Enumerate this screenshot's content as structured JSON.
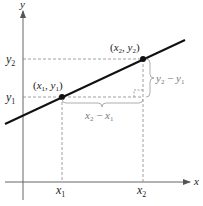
{
  "diagram": {
    "axes": {
      "x_label": "x",
      "y_label": "y",
      "x_ticks": [
        {
          "main": "x",
          "sub": "1"
        },
        {
          "main": "x",
          "sub": "2"
        }
      ],
      "y_ticks": [
        {
          "main": "y",
          "sub": "1"
        },
        {
          "main": "y",
          "sub": "2"
        }
      ]
    },
    "points": [
      {
        "label": "(x₁, y₁)",
        "parts": {
          "open": "(",
          "x": "x",
          "xs": "1",
          "comma": ", ",
          "y": "y",
          "ys": "1",
          "close": ")"
        }
      },
      {
        "label": "(x₂, y₂)",
        "parts": {
          "open": "(",
          "x": "x",
          "xs": "2",
          "comma": ", ",
          "y": "y",
          "ys": "2",
          "close": ")"
        }
      }
    ],
    "run_label": {
      "a": "x",
      "as": "2",
      "op": " − ",
      "b": "x",
      "bs": "1"
    },
    "rise_label": {
      "a": "y",
      "as": "2",
      "op": " − ",
      "b": "y",
      "bs": "1"
    },
    "colors": {
      "line": "#111111",
      "axis": "#666666",
      "dashed": "#888888",
      "bracket": "#999999",
      "text": "#222222"
    }
  }
}
